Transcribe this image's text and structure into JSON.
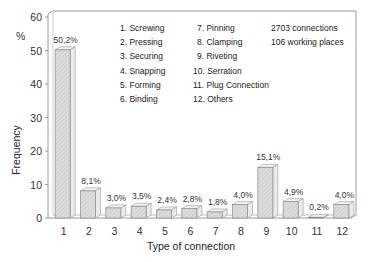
{
  "chart_data": {
    "type": "bar",
    "title": "",
    "xlabel": "Type of connection",
    "ylabel": "Frequency",
    "y_unit": "%",
    "ylim": [
      0,
      60
    ],
    "yticks": [
      0,
      10,
      20,
      30,
      40,
      50,
      60
    ],
    "grid": false,
    "style": "3d-bars-hatched",
    "categories": [
      "1",
      "2",
      "3",
      "4",
      "5",
      "6",
      "7",
      "8",
      "9",
      "10",
      "11",
      "12"
    ],
    "values": [
      50.2,
      8.1,
      3.0,
      3.5,
      2.4,
      2.8,
      1.8,
      4.0,
      15.1,
      4.9,
      0.2,
      4.0
    ],
    "value_labels": [
      "50,2%",
      "8,1%",
      "3,0%",
      "3,5%",
      "2,4%",
      "2,8%",
      "1,8%",
      "4,0%",
      "15,1%",
      "4,9%",
      "0,2%",
      "4,0%"
    ],
    "legend": {
      "position": "top-inside",
      "col1": [
        "1. Screwing",
        "2. Pressing",
        "3. Securing",
        "4. Snapping",
        "5. Forming",
        "6. Binding"
      ],
      "col2": [
        "7. Pinning",
        "8. Clamping",
        "9. Riveting",
        "10. Serration",
        "11. Plug Connection",
        "12. Others"
      ]
    },
    "annotations": [
      "2703 connections",
      "106 working places"
    ]
  },
  "colors": {
    "bar_face": "#d9d9d9",
    "bar_top": "#f2f2f2",
    "bar_side": "#ebebeb",
    "frame": "#9a9a9a"
  }
}
